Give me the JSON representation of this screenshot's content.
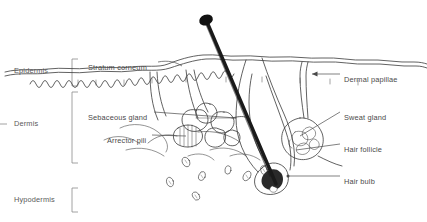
{
  "figure": {
    "background_color": "#ffffff",
    "ink_color": "#3a3a3a",
    "text_color": "#4a4a4a"
  },
  "layer_brackets": [
    {
      "id": "epidermis",
      "label": "Epidermis",
      "label_x": 14,
      "label_y": 67,
      "bracket_x": 72,
      "bracket_top": 59,
      "bracket_bottom": 86
    },
    {
      "id": "dermis",
      "label": "Dermis",
      "label_x": 14,
      "label_y": 120,
      "bracket_x": 72,
      "bracket_top": 92,
      "bracket_bottom": 163
    },
    {
      "id": "hypodermis",
      "label": "Hypodermis",
      "label_x": 14,
      "label_y": 196,
      "bracket_x": 72,
      "bracket_top": 188,
      "bracket_bottom": 212
    }
  ],
  "interior_labels": [
    {
      "id": "stratum-corneum",
      "label": "Stratum corneum",
      "x": 88,
      "y": 64
    },
    {
      "id": "sebaceous-gland",
      "label": "Sebaceous gland",
      "x": 88,
      "y": 114
    },
    {
      "id": "arrector-pili",
      "label": "Arrector pili",
      "x": 107,
      "y": 137
    }
  ],
  "right_labels": [
    {
      "id": "dermal-papillae",
      "label": "Dermal papillae",
      "x": 344,
      "y": 76
    },
    {
      "id": "sweat-gland",
      "label": "Sweat gland",
      "x": 344,
      "y": 114
    },
    {
      "id": "hair-follicle",
      "label": "Hair follicle",
      "x": 344,
      "y": 146
    },
    {
      "id": "hair-bulb",
      "label": "Hair bulb",
      "x": 344,
      "y": 178
    }
  ],
  "structures": {
    "hair_shaft": "hair-shaft",
    "hair_bulb": "hair-bulb",
    "skin_surface": "skin-surface",
    "dermal_epidermal_junction": "wavy-junction",
    "sebaceous_gland": "sebaceous-gland-lobes",
    "arrector_pili_muscle": "arrector-pili-muscle",
    "sweat_gland_coil": "sweat-gland-coil",
    "sweat_duct": "sweat-duct",
    "adipose_cells": "adipose-cells"
  }
}
